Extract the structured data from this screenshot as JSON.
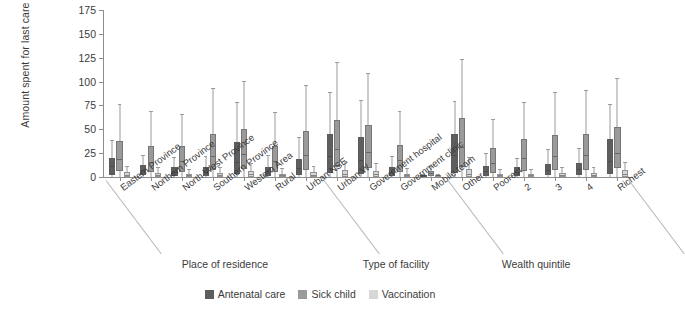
{
  "chart_data": {
    "type": "box",
    "title": "",
    "xlabel": "",
    "ylabel": "Amount spent for last care (Le)",
    "ylim": [
      0,
      175
    ],
    "yticks": [
      0,
      25,
      50,
      75,
      100,
      125,
      150,
      175
    ],
    "grid": false,
    "legend_position": "bottom",
    "series": [
      {
        "name": "Antenatal care",
        "color": "#5e5e5e"
      },
      {
        "name": "Sick child",
        "color": "#9a9a9a"
      },
      {
        "name": "Vaccination",
        "color": "#d7d7d7"
      }
    ],
    "group_headers": [
      {
        "label": "Place of residence",
        "from": 0,
        "to": 6
      },
      {
        "label": "Type of facility",
        "from": 7,
        "to": 10
      },
      {
        "label": "Wealth quintile",
        "from": 11,
        "to": 15
      }
    ],
    "categories": [
      "Eastern Province",
      "Northern Province",
      "North West Province",
      "Southern Province",
      "Western Area",
      "Rural",
      "Urban NSE",
      "Urban W",
      "Government hospital",
      "Government clinic",
      "Mobile team",
      "Other",
      "Poorest",
      "2",
      "3",
      "4",
      "Richest"
    ],
    "boxes": {
      "Antenatal care": [
        {
          "min": 0,
          "q1": 2,
          "median": 10,
          "q3": 20,
          "max": 38
        },
        {
          "min": 0,
          "q1": 2,
          "median": 6,
          "q3": 13,
          "max": 22
        },
        {
          "min": 0,
          "q1": 1,
          "median": 4,
          "q3": 10,
          "max": 20
        },
        {
          "min": 0,
          "q1": 1,
          "median": 4,
          "q3": 10,
          "max": 21
        },
        {
          "min": 0,
          "q1": 3,
          "median": 14,
          "q3": 37,
          "max": 78
        },
        {
          "min": 0,
          "q1": 1,
          "median": 5,
          "q3": 11,
          "max": 22
        },
        {
          "min": 0,
          "q1": 2,
          "median": 8,
          "q3": 19,
          "max": 41
        },
        {
          "min": 0,
          "q1": 4,
          "median": 20,
          "q3": 45,
          "max": 88
        },
        {
          "min": 0,
          "q1": 3,
          "median": 16,
          "q3": 42,
          "max": 80
        },
        {
          "min": 0,
          "q1": 1,
          "median": 4,
          "q3": 10,
          "max": 21
        },
        {
          "min": 0,
          "q1": 0,
          "median": 0,
          "q3": 1,
          "max": 2
        },
        {
          "min": 0,
          "q1": 4,
          "median": 22,
          "q3": 45,
          "max": 79
        },
        {
          "min": 0,
          "q1": 1,
          "median": 5,
          "q3": 12,
          "max": 24
        },
        {
          "min": 0,
          "q1": 1,
          "median": 4,
          "q3": 10,
          "max": 19
        },
        {
          "min": 0,
          "q1": 2,
          "median": 6,
          "q3": 14,
          "max": 28
        },
        {
          "min": 0,
          "q1": 2,
          "median": 7,
          "q3": 15,
          "max": 29
        },
        {
          "min": 0,
          "q1": 3,
          "median": 15,
          "q3": 40,
          "max": 75
        }
      ],
      "Sick child": [
        {
          "min": 0,
          "q1": 6,
          "median": 17,
          "q3": 38,
          "max": 75
        },
        {
          "min": 0,
          "q1": 5,
          "median": 14,
          "q3": 33,
          "max": 68
        },
        {
          "min": 0,
          "q1": 5,
          "median": 15,
          "q3": 32,
          "max": 65
        },
        {
          "min": 0,
          "q1": 7,
          "median": 20,
          "q3": 45,
          "max": 92
        },
        {
          "min": 0,
          "q1": 8,
          "median": 23,
          "q3": 50,
          "max": 100
        },
        {
          "min": 0,
          "q1": 5,
          "median": 15,
          "q3": 33,
          "max": 67
        },
        {
          "min": 0,
          "q1": 7,
          "median": 22,
          "q3": 48,
          "max": 95
        },
        {
          "min": 0,
          "q1": 10,
          "median": 28,
          "q3": 60,
          "max": 120
        },
        {
          "min": 0,
          "q1": 9,
          "median": 25,
          "q3": 55,
          "max": 108
        },
        {
          "min": 0,
          "q1": 5,
          "median": 16,
          "q3": 34,
          "max": 68
        },
        {
          "min": 0,
          "q1": 1,
          "median": 3,
          "q3": 6,
          "max": 11
        },
        {
          "min": 0,
          "q1": 10,
          "median": 30,
          "q3": 62,
          "max": 123
        },
        {
          "min": 0,
          "q1": 4,
          "median": 13,
          "q3": 30,
          "max": 60
        },
        {
          "min": 0,
          "q1": 6,
          "median": 18,
          "q3": 40,
          "max": 78
        },
        {
          "min": 0,
          "q1": 7,
          "median": 20,
          "q3": 44,
          "max": 88
        },
        {
          "min": 0,
          "q1": 7,
          "median": 21,
          "q3": 45,
          "max": 90
        },
        {
          "min": 0,
          "q1": 9,
          "median": 24,
          "q3": 52,
          "max": 103
        }
      ],
      "Vaccination": [
        {
          "min": 0,
          "q1": 0,
          "median": 1,
          "q3": 5,
          "max": 11
        },
        {
          "min": 0,
          "q1": 0,
          "median": 1,
          "q3": 4,
          "max": 9
        },
        {
          "min": 0,
          "q1": 0,
          "median": 1,
          "q3": 3,
          "max": 7
        },
        {
          "min": 0,
          "q1": 0,
          "median": 1,
          "q3": 4,
          "max": 9
        },
        {
          "min": 0,
          "q1": 0,
          "median": 2,
          "q3": 6,
          "max": 14
        },
        {
          "min": 0,
          "q1": 0,
          "median": 1,
          "q3": 3,
          "max": 8
        },
        {
          "min": 0,
          "q1": 0,
          "median": 1,
          "q3": 5,
          "max": 11
        },
        {
          "min": 0,
          "q1": 0,
          "median": 2,
          "q3": 7,
          "max": 16
        },
        {
          "min": 0,
          "q1": 0,
          "median": 2,
          "q3": 6,
          "max": 14
        },
        {
          "min": 0,
          "q1": 0,
          "median": 1,
          "q3": 3,
          "max": 8
        },
        {
          "min": 0,
          "q1": 0,
          "median": 0,
          "q3": 1,
          "max": 2
        },
        {
          "min": 0,
          "q1": 0,
          "median": 2,
          "q3": 8,
          "max": 20
        },
        {
          "min": 0,
          "q1": 0,
          "median": 1,
          "q3": 3,
          "max": 7
        },
        {
          "min": 0,
          "q1": 0,
          "median": 1,
          "q3": 3,
          "max": 7
        },
        {
          "min": 0,
          "q1": 0,
          "median": 1,
          "q3": 4,
          "max": 9
        },
        {
          "min": 0,
          "q1": 0,
          "median": 1,
          "q3": 4,
          "max": 9
        },
        {
          "min": 0,
          "q1": 0,
          "median": 2,
          "q3": 7,
          "max": 15
        }
      ]
    }
  }
}
